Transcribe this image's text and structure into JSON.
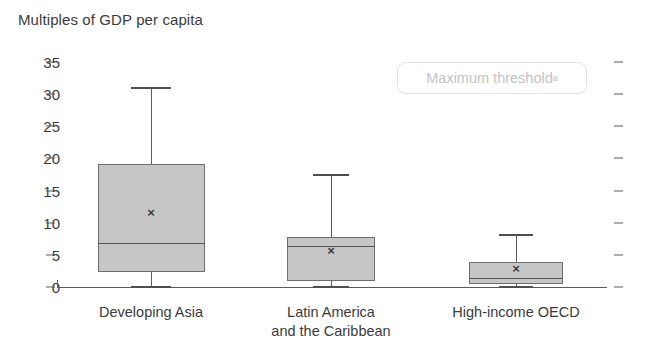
{
  "chart_data": {
    "type": "box",
    "title": "Multiples of GDP per capita",
    "xlabel": "",
    "ylabel": "Multiples of GDP per capita",
    "ylim": [
      0,
      35
    ],
    "yticks": [
      0,
      5,
      10,
      15,
      20,
      25,
      30,
      35
    ],
    "ytick_labels": [
      "0",
      "5",
      "10",
      "15",
      "20",
      "25",
      "30",
      "35"
    ],
    "grid": false,
    "legend_position": "top-right",
    "categories": [
      "Developing Asia",
      "Latin America and the Caribbean",
      "High-income OECD"
    ],
    "series": [
      {
        "name": "Developing Asia",
        "label_line1": "Developing Asia",
        "label_line2": "",
        "whisker_low": 0.0,
        "q1": 2.3,
        "median": 6.8,
        "q3": 19.2,
        "whisker_high": 31.0,
        "mean": 11.6
      },
      {
        "name": "Latin America and the Caribbean",
        "label_line1": "Latin America",
        "label_line2": "and the Caribbean",
        "whisker_low": 0.0,
        "q1": 0.9,
        "median": 6.4,
        "q3": 7.8,
        "whisker_high": 17.4,
        "mean": 5.7
      },
      {
        "name": "High-income OECD",
        "label_line1": "High-income OECD",
        "label_line2": "",
        "whisker_low": 0.0,
        "q1": 0.5,
        "median": 1.4,
        "q3": 3.9,
        "whisker_high": 8.1,
        "mean": 2.9
      }
    ],
    "annotations": [
      {
        "id": "maximum-threshold",
        "text": "Maximum threshold",
        "superscript": "a"
      }
    ],
    "colors": {
      "box_fill": "#c6c6c6",
      "box_stroke": "#6e6e6e",
      "axis": "#5a5a5a",
      "text": "#3b3b3b",
      "annotation_text": "#c3c3c3",
      "annotation_border": "#e2e2e2"
    }
  }
}
